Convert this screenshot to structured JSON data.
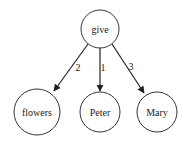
{
  "diagram": {
    "type": "dependency-tree",
    "nodes": [
      {
        "id": "give",
        "label": "give",
        "cx": 100,
        "cy": 29,
        "r": 19
      },
      {
        "id": "flowers",
        "label": "flowers",
        "cx": 37,
        "cy": 112,
        "r": 23
      },
      {
        "id": "peter",
        "label": "Peter",
        "cx": 100,
        "cy": 112,
        "r": 20
      },
      {
        "id": "mary",
        "label": "Mary",
        "cx": 157,
        "cy": 112,
        "r": 20
      }
    ],
    "edges": [
      {
        "from": "give",
        "to": "flowers",
        "label": "2"
      },
      {
        "from": "give",
        "to": "peter",
        "label": "1"
      },
      {
        "from": "give",
        "to": "mary",
        "label": "3"
      }
    ]
  }
}
